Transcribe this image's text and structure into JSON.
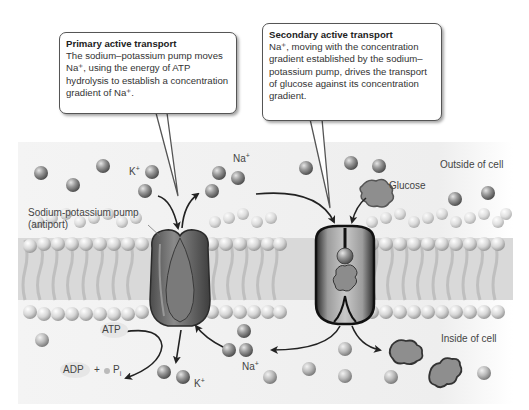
{
  "callouts": {
    "primary": {
      "title": "Primary active transport",
      "body": "The sodium–potassium pump moves Na⁺, using the energy of ATP hydrolysis to establish a concentration gradient of Na⁺."
    },
    "secondary": {
      "title": "Secondary active transport",
      "body": "Na⁺, moving with the concentration gradient established by the sodium–potassium pump, drives the transport of glucose against its concentration gradient."
    }
  },
  "labels": {
    "outside": "Outside of cell",
    "inside": "Inside of cell",
    "pump_line1": "Sodium-potassium pump",
    "pump_line2": "(antiport)",
    "glucose": "Glucose",
    "na_top": "Na",
    "na_bottom": "Na",
    "k_top": "K",
    "k_bottom": "K",
    "plus_sign": "+",
    "atp": "ATP",
    "adp": "ADP",
    "plus": "+",
    "pi": "P",
    "pi_sub": "i"
  },
  "colors": {
    "background": "#ffffff",
    "region_bg": "#f1f1f1",
    "ion_ball": "#8a8a8a",
    "protein": "#6e6e6e",
    "lipid_head": "#d4d4d4",
    "arrow": "#222222"
  }
}
